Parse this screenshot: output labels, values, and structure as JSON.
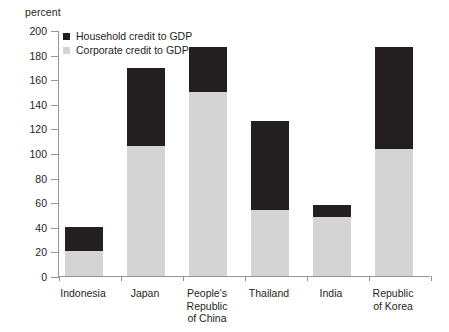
{
  "chart_data": {
    "type": "bar",
    "title": "",
    "subtitle": "",
    "unit_label": "percent",
    "xlabel": "",
    "ylabel": "",
    "ylim": [
      0,
      200
    ],
    "ytick_interval": 20,
    "yticks": [
      200,
      180,
      160,
      140,
      120,
      100,
      80,
      60,
      40,
      20,
      0
    ],
    "ytick_labels": [
      "200",
      "180",
      "160",
      "140",
      "120",
      "100",
      "80",
      "60",
      "40",
      "20",
      "0"
    ],
    "grid": false,
    "stacked": true,
    "legend_position": "top-left-inside",
    "categories": [
      "Indonesia",
      "Japan",
      "People's\nRepublic\nof China",
      "Thailand",
      "India",
      "Republic\nof Korea"
    ],
    "series": [
      {
        "name": "Corporate credit to GDP",
        "color": "#d4d4d4",
        "values": [
          20,
          106,
          150,
          54,
          48,
          103
        ]
      },
      {
        "name": "Household credit to GDP",
        "color": "#231f20",
        "values": [
          20,
          63,
          36,
          72,
          10,
          83
        ]
      }
    ],
    "totals": [
      40,
      169,
      186,
      126,
      58,
      186
    ]
  },
  "legend": {
    "items": [
      {
        "label": "Household credit to GDP",
        "swatch": "household-swatch"
      },
      {
        "label": "Corporate credit to GDP",
        "swatch": "corporate-swatch"
      }
    ]
  },
  "colors": {
    "household": "#231f20",
    "corporate": "#d4d4d4",
    "axis": "#939598",
    "text": "#231f20",
    "background": "#ffffff"
  }
}
